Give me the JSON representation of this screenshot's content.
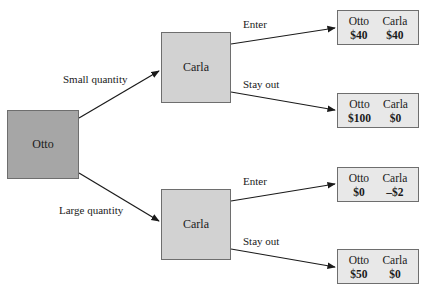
{
  "diagram": {
    "type": "game-tree",
    "root": {
      "player": "Otto"
    },
    "first_moves": [
      {
        "label": "Small quantity",
        "next_player": "Carla"
      },
      {
        "label": "Large quantity",
        "next_player": "Carla"
      }
    ],
    "second_moves": [
      {
        "label": "Enter"
      },
      {
        "label": "Stay out"
      },
      {
        "label": "Enter"
      },
      {
        "label": "Stay out"
      }
    ],
    "payoffs": [
      {
        "p1": "Otto",
        "p1_value": "$40",
        "p2": "Carla",
        "p2_value": "$40"
      },
      {
        "p1": "Otto",
        "p1_value": "$100",
        "p2": "Carla",
        "p2_value": "$0"
      },
      {
        "p1": "Otto",
        "p1_value": "$0",
        "p2": "Carla",
        "p2_value": "–$2"
      },
      {
        "p1": "Otto",
        "p1_value": "$50",
        "p2": "Carla",
        "p2_value": "$0"
      }
    ],
    "colors": {
      "root_fill": "#a6a6a6",
      "carla_fill": "#d2d2d2",
      "payoff_fill": "#e8e8e8",
      "border": "#6e6e6e",
      "edge": "#1a1a1a"
    }
  }
}
